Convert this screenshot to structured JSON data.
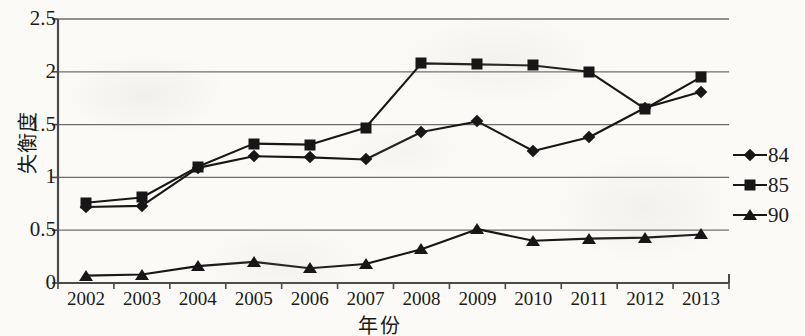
{
  "chart_data": {
    "type": "line",
    "title": "",
    "xlabel": "年份",
    "ylabel": "失衡度",
    "categories": [
      "2002",
      "2003",
      "2004",
      "2005",
      "2006",
      "2007",
      "2008",
      "2009",
      "2010",
      "2011",
      "2012",
      "2013"
    ],
    "ylim": [
      0,
      2.5
    ],
    "yticks": [
      "0",
      "0.5",
      "1",
      "1.5",
      "2",
      "2.5"
    ],
    "ytick_values": [
      0,
      0.5,
      1,
      1.5,
      2,
      2.5
    ],
    "grid": true,
    "legend_position": "right",
    "series": [
      {
        "name": "84",
        "marker": "diamond",
        "values": [
          0.72,
          0.73,
          1.09,
          1.2,
          1.19,
          1.17,
          1.43,
          1.53,
          1.25,
          1.38,
          1.66,
          1.81
        ]
      },
      {
        "name": "85",
        "marker": "square",
        "values": [
          0.76,
          0.81,
          1.1,
          1.32,
          1.31,
          1.47,
          2.08,
          2.07,
          2.06,
          2.0,
          1.65,
          1.95
        ]
      },
      {
        "name": "90",
        "marker": "triangle",
        "values": [
          0.07,
          0.08,
          0.16,
          0.2,
          0.14,
          0.18,
          0.32,
          0.51,
          0.4,
          0.42,
          0.43,
          0.46
        ]
      }
    ]
  },
  "axis": {
    "y_title": "失衡度",
    "x_title": "年份"
  }
}
